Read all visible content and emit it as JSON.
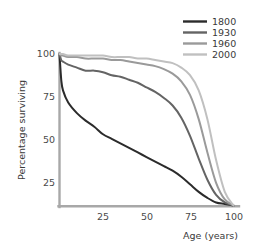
{
  "chart_data": {
    "type": "line",
    "title": "",
    "subtitle": "",
    "xlabel": "Age (years)",
    "ylabel": "Percentage surviving",
    "xlim": [
      0,
      105
    ],
    "ylim": [
      0,
      103
    ],
    "xticks": [
      25,
      50,
      75,
      100
    ],
    "xtick_labels": [
      "25",
      "50",
      "75",
      "100"
    ],
    "yticks": [
      25,
      50,
      75,
      100
    ],
    "ytick_labels": [
      "25",
      "50",
      "75",
      "100"
    ],
    "grid": false,
    "legend_position": "top-right",
    "x": [
      0,
      1,
      2,
      5,
      10,
      15,
      20,
      25,
      30,
      35,
      40,
      45,
      50,
      55,
      60,
      65,
      70,
      75,
      80,
      85,
      90,
      95,
      100
    ],
    "series": [
      {
        "name": "1800",
        "color": "#2b2b2b",
        "values": [
          100,
          83,
          76,
          68,
          61,
          56,
          52,
          47,
          44,
          41,
          38,
          35,
          32,
          29,
          26,
          23,
          19,
          14,
          9,
          5,
          2,
          1,
          0
        ]
      },
      {
        "name": "1930",
        "color": "#646464",
        "values": [
          100,
          96,
          95,
          93,
          91,
          89,
          89,
          88,
          86,
          85,
          83,
          81,
          78,
          75,
          71,
          66,
          58,
          46,
          31,
          17,
          7,
          2,
          0
        ]
      },
      {
        "name": "1960",
        "color": "#9a9a9a",
        "values": [
          100,
          99,
          99,
          98,
          98,
          97,
          97,
          97,
          96,
          96,
          95,
          94,
          93,
          92,
          90,
          87,
          82,
          73,
          57,
          35,
          15,
          4,
          0
        ]
      },
      {
        "name": "2000",
        "color": "#c0c0c0",
        "values": [
          100,
          100,
          100,
          99,
          99,
          99,
          99,
          99,
          98,
          98,
          98,
          97,
          97,
          96,
          95,
          94,
          91,
          86,
          76,
          57,
          30,
          9,
          0
        ]
      }
    ]
  },
  "legend": {
    "entries": [
      {
        "label": "1800",
        "swatch": "legend-swatch-1800"
      },
      {
        "label": "1930",
        "swatch": "legend-swatch-1930"
      },
      {
        "label": "1960",
        "swatch": "legend-swatch-1960"
      },
      {
        "label": "2000",
        "swatch": "legend-swatch-2000"
      }
    ]
  },
  "axes": {
    "x_title": "Age (years)",
    "y_title": "Percentage surviving",
    "x_tick_1": "25",
    "x_tick_2": "50",
    "x_tick_3": "75",
    "x_tick_4": "100",
    "y_tick_1": "25",
    "y_tick_2": "50",
    "y_tick_3": "75",
    "y_tick_4": "100",
    "axis_color": "#a8a8a8"
  }
}
